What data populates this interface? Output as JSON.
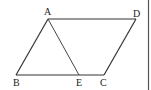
{
  "diagram": {
    "type": "geometry",
    "shape": "parallelogram",
    "points": {
      "A": {
        "label": "A",
        "x": 48,
        "y": 19
      },
      "D": {
        "label": "D",
        "x": 136,
        "y": 19
      },
      "B": {
        "label": "B",
        "x": 16,
        "y": 75
      },
      "C": {
        "label": "C",
        "x": 104,
        "y": 75
      },
      "E": {
        "label": "E",
        "x": 79,
        "y": 75
      }
    },
    "segments": [
      "AD",
      "AB",
      "BC",
      "CD",
      "AE"
    ],
    "colors": {
      "stroke": "#333333",
      "border": "#555555"
    }
  }
}
